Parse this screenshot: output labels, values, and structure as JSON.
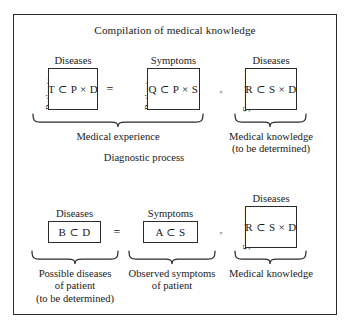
{
  "figure": {
    "title": "Compilation of medical knowledge",
    "border_color": "#2b2b2b",
    "background": "#ffffff"
  },
  "top_row": {
    "label_diagnostic": "Diagnostic process",
    "matrices": [
      {
        "id": "T",
        "column_header": "Diseases",
        "row_header": "Patients",
        "content": "T ⊂ P × D"
      },
      {
        "id": "Q",
        "column_header": "Symptoms",
        "row_header": "Patients",
        "content": "Q ⊂ P × S"
      },
      {
        "id": "R",
        "column_header": "Diseases",
        "row_header": "Symptoms",
        "content": "R ⊂ S × D"
      }
    ],
    "operators": [
      {
        "id": "equals",
        "symbol": "="
      },
      {
        "id": "composition",
        "symbol": "◦"
      }
    ],
    "captions": [
      {
        "id": "medical-experience",
        "lines": [
          "Medical experience"
        ]
      },
      {
        "id": "medical-knowledge-top",
        "lines": [
          "Medical knowledge",
          "(to be determined)"
        ]
      }
    ]
  },
  "bottom_row": {
    "matrices": [
      {
        "id": "B",
        "column_header": "Diseases",
        "row_header": "",
        "content": "B ⊂ D"
      },
      {
        "id": "A",
        "column_header": "Symptoms",
        "row_header": "",
        "content": "A ⊂ S"
      },
      {
        "id": "R",
        "column_header": "Diseases",
        "row_header": "Symptoms",
        "content": "R ⊂ S × D"
      }
    ],
    "operators": [
      {
        "id": "equals",
        "symbol": "="
      },
      {
        "id": "composition",
        "symbol": "◦"
      }
    ],
    "captions": [
      {
        "id": "possible-diseases",
        "lines": [
          "Possible diseases",
          "of patient",
          "(to be determined)"
        ]
      },
      {
        "id": "observed-symptoms",
        "lines": [
          "Observed symptoms",
          "of patient"
        ]
      },
      {
        "id": "medical-knowledge-bottom",
        "lines": [
          "Medical knowledge"
        ]
      }
    ]
  }
}
